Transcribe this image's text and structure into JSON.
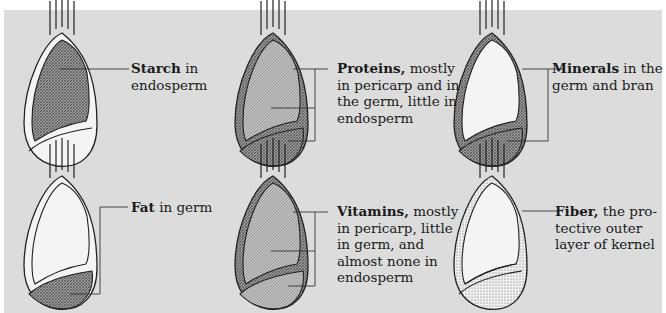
{
  "diagram": {
    "colors": {
      "panel": "#dcdcdc",
      "outline": "#2b2b2b",
      "light_fill": "#f4f4f4",
      "dense_hatch": "#7a7a7a",
      "medium_hatch": "#a8a8a8"
    },
    "panels": [
      {
        "id": "starch",
        "bold": "Starch",
        "lines": [
          " in",
          "endosperm"
        ],
        "highlight": "endosperm"
      },
      {
        "id": "proteins",
        "bold": "Proteins,",
        "lines": [
          " mostly",
          "in pericarp and in",
          "the germ, little in",
          "endosperm"
        ],
        "highlight": "pericarp-germ-endosperm"
      },
      {
        "id": "minerals",
        "bold": "Minerals",
        "lines": [
          " in the",
          "germ and bran"
        ],
        "highlight": "germ-bran"
      },
      {
        "id": "fat",
        "bold": "Fat",
        "lines": [
          " in germ"
        ],
        "highlight": "germ"
      },
      {
        "id": "vitamins",
        "bold": "Vitamins,",
        "lines": [
          " mostly",
          "in pericarp, little",
          "in germ, and",
          "almost none in",
          "endosperm"
        ],
        "highlight": "pericarp-germ-endosperm"
      },
      {
        "id": "fiber",
        "bold": "Fiber,",
        "lines": [
          " the pro-",
          "tective outer",
          "layer of kernel"
        ],
        "highlight": "outer-layer"
      }
    ]
  }
}
